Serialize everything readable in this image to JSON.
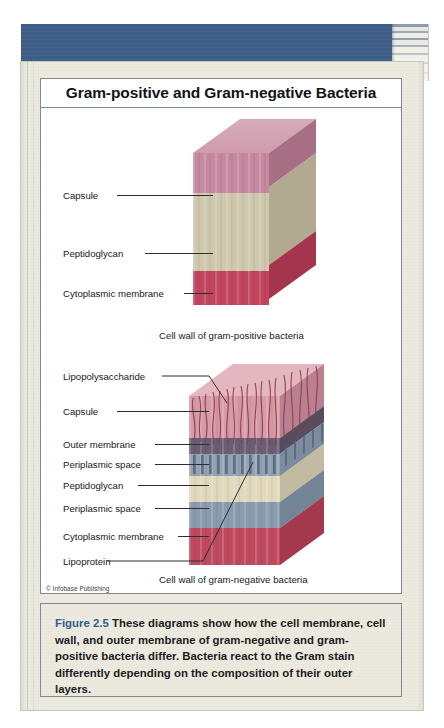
{
  "page": {
    "credit": "© Infobase Publishing"
  },
  "figure": {
    "title": "Gram-positive and Gram-negative Bacteria",
    "caption_label": "Figure 2.5",
    "caption_text": "These diagrams show how the cell membrane, cell wall, and outer membrane of gram-negative and gram-positive bacteria differ. Bacteria react to the Gram stain differently depending on the composition of their outer layers.",
    "caption_accent_color": "#2c5d8f"
  },
  "diagram_gram_positive": {
    "subcaption": "Cell wall of gram-positive bacteria",
    "labels": [
      {
        "text": "Capsule"
      },
      {
        "text": "Peptidoglycan"
      },
      {
        "text": "Cytoplasmic membrane"
      }
    ],
    "layers": [
      {
        "name": "Capsule",
        "color": "#c58a9f",
        "side_color": "#b5778e",
        "top_color": "#cf9bac"
      },
      {
        "name": "Peptidoglycan",
        "color": "#cfc8ae",
        "side_color": "#bfb79d",
        "top_color": "#d8d2ba"
      },
      {
        "name": "Cytoplasmic membrane",
        "color": "#c2455f",
        "side_color": "#b23a53",
        "top_color": "#cc5a72"
      }
    ]
  },
  "diagram_gram_negative": {
    "subcaption": "Cell wall of gram-negative bacteria",
    "labels": [
      {
        "text": "Lipopolysaccharide"
      },
      {
        "text": "Capsule"
      },
      {
        "text": "Outer membrane"
      },
      {
        "text": "Periplasmic space"
      },
      {
        "text": "Peptidoglycan"
      },
      {
        "text": "Periplasmic space"
      },
      {
        "text": "Cytoplasmic membrane"
      },
      {
        "text": "Lipoprotein"
      }
    ],
    "layers": [
      {
        "name": "Capsule",
        "color": "#d79aa7",
        "side_color": "#c6889a",
        "top_color": "#dfa8b3"
      },
      {
        "name": "Outer membrane",
        "color": "#6a5e74",
        "side_color": "#5d5267",
        "top_color": "#776a81"
      },
      {
        "name": "Periplasmic space",
        "color": "#93a3b5",
        "side_color": "#8494a8",
        "top_color": "#a0aebf"
      },
      {
        "name": "Peptidoglycan",
        "color": "#e2d9bd",
        "side_color": "#d0c7ac",
        "top_color": "#eae2c9"
      },
      {
        "name": "Periplasmic space",
        "color": "#8a9cae",
        "side_color": "#7b8da0",
        "top_color": "#98a8b9"
      },
      {
        "name": "Cytoplasmic membrane",
        "color": "#bf4a60",
        "side_color": "#af3d53",
        "top_color": "#ca5c71"
      }
    ],
    "lps_strand_color": "#8d3b4e",
    "lipoprotein_color": "#5b6b7d"
  }
}
